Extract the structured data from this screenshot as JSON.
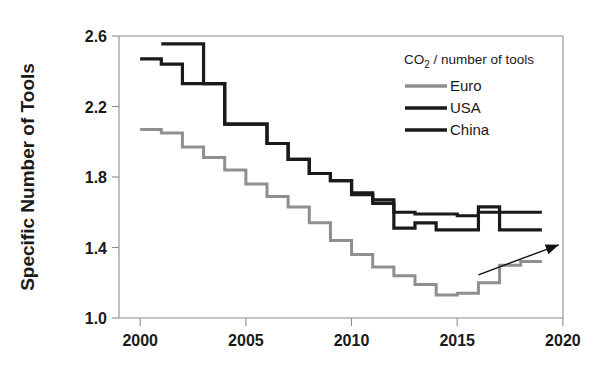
{
  "chart_data": {
    "type": "line",
    "title": "",
    "xlabel": "",
    "ylabel": "Specific Number of Tools",
    "xlim": [
      1999,
      2020
    ],
    "ylim": [
      1.0,
      2.6
    ],
    "xticks": [
      "2000",
      "2005",
      "2010",
      "2015",
      "2020"
    ],
    "xtick_values": [
      2000,
      2005,
      2010,
      2015,
      2020
    ],
    "yticks": [
      "1.0",
      "1.4",
      "1.8",
      "2.2",
      "2.6"
    ],
    "ytick_values": [
      1.0,
      1.4,
      1.8,
      2.2,
      2.6
    ],
    "grid": false,
    "step_style": "post",
    "legend_position": "upper-right",
    "legend_title": "CO",
    "legend_title_sub": "2",
    "legend_title_rest": " / number of tools",
    "x": [
      2000,
      2001,
      2002,
      2003,
      2004,
      2005,
      2006,
      2007,
      2008,
      2009,
      2010,
      2011,
      2012,
      2013,
      2014,
      2015,
      2016,
      2017,
      2018
    ],
    "series": [
      {
        "name": "Euro",
        "color": "#8f8f8f",
        "width": 3.0,
        "values": [
          2.07,
          2.05,
          1.97,
          1.91,
          1.84,
          1.76,
          1.69,
          1.63,
          1.54,
          1.44,
          1.36,
          1.29,
          1.24,
          1.19,
          1.13,
          1.14,
          1.2,
          1.3,
          1.32
        ]
      },
      {
        "name": "USA",
        "color": "#1a1a1a",
        "width": 3.2,
        "values": [
          2.47,
          2.44,
          2.33,
          2.33,
          2.1,
          2.1,
          1.99,
          1.9,
          1.82,
          1.78,
          1.7,
          1.65,
          1.51,
          1.54,
          1.5,
          1.5,
          1.63,
          1.5,
          1.5
        ]
      },
      {
        "name": "China",
        "color": "#1a1a1a",
        "width": 3.2,
        "values": [
          null,
          2.555,
          2.555,
          2.33,
          2.1,
          2.1,
          1.99,
          1.9,
          1.82,
          1.78,
          1.71,
          1.67,
          1.6,
          1.59,
          1.59,
          1.58,
          1.6,
          1.6,
          1.6
        ]
      }
    ],
    "annotations": [
      {
        "type": "arrow",
        "name": "upward-trend-arrow",
        "from": [
          2016.0,
          1.245
        ],
        "to": [
          2019.8,
          1.415
        ]
      }
    ]
  },
  "legend": {
    "title_main": "CO",
    "title_sub": "2",
    "title_tail": " / number of tools",
    "items": [
      {
        "label": "Euro",
        "color": "#8f8f8f"
      },
      {
        "label": "USA",
        "color": "#1a1a1a"
      },
      {
        "label": "China",
        "color": "#1a1a1a"
      }
    ]
  }
}
